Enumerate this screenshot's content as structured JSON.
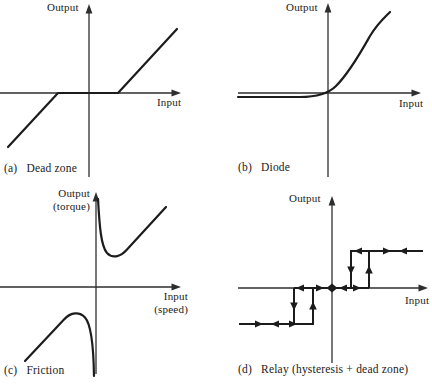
{
  "colors": {
    "background": "#ffffff",
    "line": "#1c1c1c",
    "axis": "#2e2e2e",
    "text": "#1a1a1a"
  },
  "figure_type": "nonlinear-characteristics-figure",
  "panels": [
    {
      "key": "a",
      "caption_prefix": "(a)",
      "caption": "Dead zone",
      "y_axis_label": "Output",
      "x_axis_label": "Input"
    },
    {
      "key": "b",
      "caption_prefix": "(b)",
      "caption": "Diode",
      "y_axis_label": "Output",
      "x_axis_label": "Input"
    },
    {
      "key": "c",
      "caption_prefix": "(c)",
      "caption": "Friction",
      "y_axis_label": "Output",
      "y_axis_unit": "(torque)",
      "x_axis_label": "Input",
      "x_axis_unit": "(speed)"
    },
    {
      "key": "d",
      "caption_prefix": "(d)",
      "caption": "Relay (hysteresis + dead zone)",
      "y_axis_label": "Output",
      "x_axis_label": "Input"
    }
  ]
}
